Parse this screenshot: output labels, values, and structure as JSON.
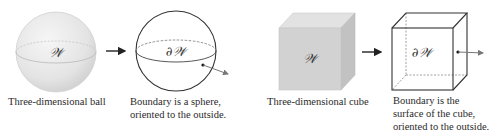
{
  "panels": [
    {
      "id": "ball",
      "label": "𝒲",
      "caption_lines": [
        "Three-dimensional ball"
      ]
    },
    {
      "id": "sphere",
      "label": "∂𝒲",
      "caption_lines": [
        "Boundary is a sphere,",
        "oriented to the outside."
      ]
    },
    {
      "id": "cube",
      "label": "𝒲",
      "caption_lines": [
        "Three-dimensional cube"
      ]
    },
    {
      "id": "cube-surface",
      "label": "∂𝒲",
      "caption_lines": [
        "Boundary is the",
        "surface of the cube,",
        "oriented to the outside."
      ]
    }
  ],
  "arrows": [
    "ball-to-sphere",
    "cube-to-surface"
  ],
  "colors": {
    "stroke": "#333333",
    "normal_vector": "#666666",
    "ball_fill": "#e6e6e6",
    "cube_front": "#d2d2d2",
    "cube_top": "#e2e2e2",
    "cube_side": "#c2c2c2"
  }
}
